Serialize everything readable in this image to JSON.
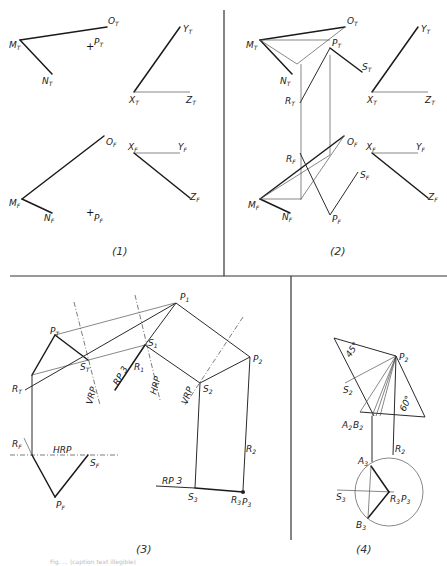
{
  "figure": {
    "panels": [
      {
        "id": "1",
        "label": "(1)"
      },
      {
        "id": "2",
        "label": "(2)"
      },
      {
        "id": "3",
        "label": "(3)"
      },
      {
        "id": "4",
        "label": "(4)"
      }
    ],
    "caption": "Fig. ... (caption text illegible)"
  },
  "panel1": {
    "labels": {
      "OT": "O",
      "MT": "M",
      "NT": "N",
      "PT": "P",
      "YT": "Y",
      "XT": "X",
      "ZT": "Z",
      "OF": "O",
      "MF": "M",
      "NF": "N",
      "PF": "P",
      "XF": "X",
      "YF": "Y",
      "ZF": "Z"
    },
    "subs": {
      "T": "T",
      "F": "F"
    }
  },
  "panel2": {
    "labels": {
      "OT": "O",
      "MT": "M",
      "NT": "N",
      "PT": "P",
      "ST": "S",
      "RT": "R",
      "YT": "Y",
      "XT": "X",
      "ZT": "Z",
      "OF": "O",
      "RF": "R",
      "SF": "S",
      "MF": "M",
      "NF": "N",
      "PF": "P",
      "XF": "X",
      "YF": "Y",
      "ZF": "Z"
    }
  },
  "panel3": {
    "labels": {
      "PT": "P",
      "ST": "S",
      "RT": "R",
      "VRP1": "VRP",
      "RP3a": "RP 3",
      "HRP1": "HRP",
      "S1": "S",
      "R1": "R",
      "P1": "P",
      "VRP2": "VRP",
      "S2": "S",
      "P2": "P",
      "R2": "R",
      "RF": "R",
      "HRP2": "HRP",
      "SF": "S",
      "PF": "P",
      "RP3b": "RP 3",
      "S3": "S",
      "R3P3": "R",
      "P3": "P"
    },
    "subs": {
      "T": "T",
      "F": "F",
      "1": "1",
      "2": "2",
      "3": "3"
    }
  },
  "panel4": {
    "labels": {
      "angle45": "45°",
      "P2": "P",
      "S2": "S",
      "angle60": "60°",
      "A2B2": "A",
      "B2": "B",
      "R2": "R",
      "A3": "A",
      "S3": "S",
      "R3P3": "R",
      "P3": "P",
      "B3": "B"
    },
    "subs": {
      "2": "2",
      "3": "3"
    }
  }
}
